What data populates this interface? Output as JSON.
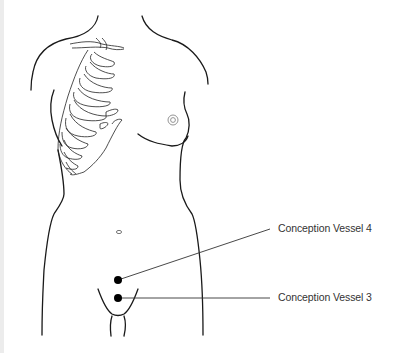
{
  "diagram": {
    "points": [
      {
        "id": "cv4",
        "label": "Conception Vessel 4",
        "x": 118,
        "y": 280
      },
      {
        "id": "cv3",
        "label": "Conception Vessel 3",
        "x": 118,
        "y": 298
      }
    ],
    "colors": {
      "outline": "#1a1a1a",
      "point": "#000000",
      "leader_line": "#333333",
      "label_text": "#333333"
    }
  }
}
